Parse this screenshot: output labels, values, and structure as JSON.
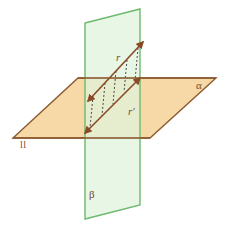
{
  "diagram": {
    "canvas": {
      "width": 230,
      "height": 227,
      "background": "#ffffff"
    },
    "planes": [
      {
        "id": "alpha",
        "label": "α",
        "role": "horizontal-plane",
        "fill": "#f7d9a8",
        "stroke": "#8a5a30",
        "points": "13,138 78,78 216,78 150,138"
      },
      {
        "id": "beta",
        "label": "β",
        "role": "vertical-plane",
        "fill": "#dff2dc",
        "stroke": "#6db96d",
        "points": "85,23 140,9 140,205 85,219"
      }
    ],
    "lines": [
      {
        "id": "r",
        "label": "r",
        "role": "line-in-vertical-plane",
        "color": "#8a4a28",
        "x1": 88,
        "y1": 101,
        "x2": 143,
        "y2": 42,
        "arrows": "both"
      },
      {
        "id": "r-prime",
        "label": "r'",
        "role": "projection-line-in-horizontal-plane",
        "color": "#8a4a28",
        "x1": 85,
        "y1": 133,
        "x2": 140,
        "y2": 78,
        "arrows": "both"
      }
    ],
    "projection_segments": {
      "count": 5,
      "color": "#3a3a3a",
      "dash": "2,2",
      "segments": [
        {
          "x1": 93,
          "y1": 96,
          "x2": 90,
          "y2": 128
        },
        {
          "x1": 105,
          "y1": 83,
          "x2": 102,
          "y2": 116
        },
        {
          "x1": 116,
          "y1": 71,
          "x2": 113,
          "y2": 104
        },
        {
          "x1": 127,
          "y1": 60,
          "x2": 124,
          "y2": 92
        },
        {
          "x1": 138,
          "y1": 48,
          "x2": 135,
          "y2": 81
        }
      ]
    },
    "labels": {
      "alpha": "α",
      "beta": "β",
      "parallel_mark": "ll",
      "line_r": "r",
      "line_r_prime": "r'"
    },
    "colors": {
      "plane_alpha_fill": "#f7d9a8",
      "plane_alpha_stroke": "#8a5a30",
      "plane_beta_fill": "#dff2dc",
      "plane_beta_stroke": "#6db96d",
      "line_color": "#8a4a28",
      "dash_color": "#3a3a3a",
      "label_color": "#7a4a2a"
    }
  }
}
